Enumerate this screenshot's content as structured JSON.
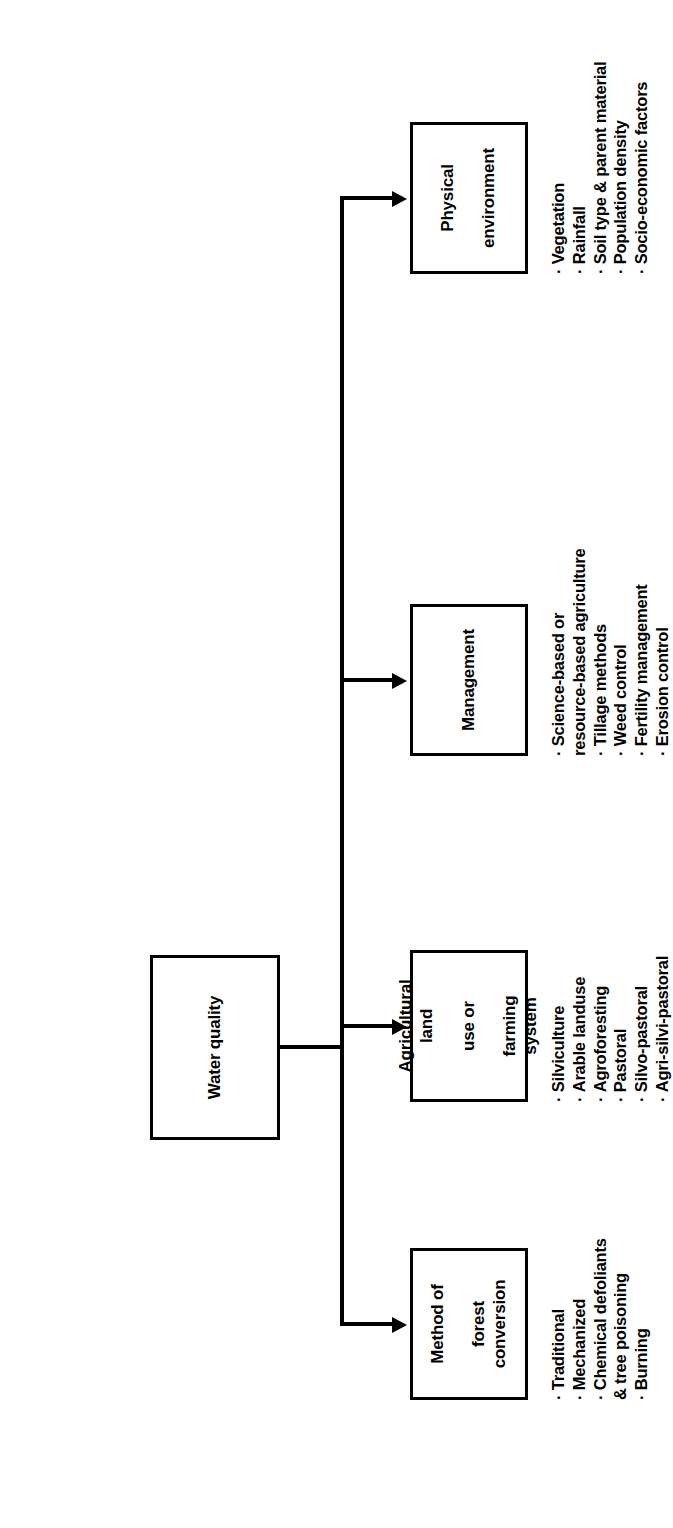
{
  "diagram": {
    "title": "Water quality",
    "root": {
      "label": "Water quality"
    },
    "branches": [
      {
        "id": "method-of-forest-conversion",
        "title_lines": [
          "Method of",
          "forest conversion"
        ],
        "bullets": [
          {
            "text": "Traditional",
            "continuation": null
          },
          {
            "text": "Mechanized",
            "continuation": null
          },
          {
            "text": "Chemical defoliants",
            "continuation": "& tree poisoning"
          },
          {
            "text": "Burning",
            "continuation": null
          }
        ]
      },
      {
        "id": "agricultural-land-use-or-farming-system",
        "title_lines": [
          "Agricultural land",
          "use or",
          "farming system"
        ],
        "bullets": [
          {
            "text": "Silviculture",
            "continuation": null
          },
          {
            "text": "Arable landuse",
            "continuation": null
          },
          {
            "text": "Agroforesting",
            "continuation": null
          },
          {
            "text": "Pastoral",
            "continuation": null
          },
          {
            "text": "Silvo-pastoral",
            "continuation": null
          },
          {
            "text": "Agri-silvi-pastoral",
            "continuation": null
          }
        ]
      },
      {
        "id": "management",
        "title_lines": [
          "Management"
        ],
        "bullets": [
          {
            "text": "Science-based or",
            "continuation": "resource-based agriculture"
          },
          {
            "text": "Tillage methods",
            "continuation": null
          },
          {
            "text": "Weed control",
            "continuation": null
          },
          {
            "text": "Fertility management",
            "continuation": null
          },
          {
            "text": "Erosion control",
            "continuation": null
          }
        ]
      },
      {
        "id": "physical-environment",
        "title_lines": [
          "Physical",
          "environment"
        ],
        "bullets": [
          {
            "text": "Vegetation",
            "continuation": null
          },
          {
            "text": "Rainfall",
            "continuation": null
          },
          {
            "text": "Soil type & parent material",
            "continuation": null
          },
          {
            "text": "Population density",
            "continuation": null
          },
          {
            "text": "Socio-economic factors",
            "continuation": null
          }
        ]
      }
    ],
    "colors": {
      "line": "#000000",
      "background": "#ffffff",
      "text": "#000000"
    }
  }
}
